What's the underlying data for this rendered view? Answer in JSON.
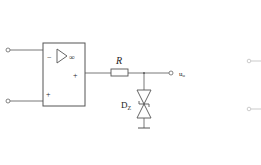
{
  "diagram": {
    "type": "circuit",
    "opamp": {
      "inverting_sign": "−",
      "noninverting_sign": "+",
      "output_sign": "+",
      "gain_symbol": "∞"
    },
    "resistor": {
      "label": "R"
    },
    "zener": {
      "label": "D",
      "label_sub": "Z"
    },
    "output": {
      "label": "u",
      "label_sub": "o"
    },
    "colors": {
      "stroke": "#555555",
      "text": "#222222"
    }
  }
}
